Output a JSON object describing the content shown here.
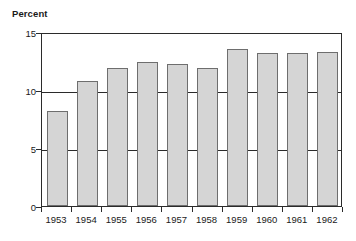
{
  "chart_data": {
    "type": "bar",
    "title": "",
    "subtitle": "",
    "xlabel": "",
    "ylabel": "Percent",
    "categories": [
      "1953",
      "1954",
      "1955",
      "1956",
      "1957",
      "1958",
      "1959",
      "1960",
      "1961",
      "1962"
    ],
    "values": [
      8.2,
      10.8,
      11.9,
      12.4,
      12.2,
      11.9,
      13.5,
      13.2,
      13.2,
      13.3
    ],
    "ylim": [
      0,
      15
    ],
    "yticks": [
      0,
      5,
      10,
      15
    ],
    "ytick_labels": [
      "0",
      "5",
      "10",
      "15"
    ],
    "xtick_labels": [
      "1953",
      "1954",
      "1955",
      "1956",
      "1957",
      "1958",
      "1959",
      "1960",
      "1961",
      "1962"
    ],
    "grid": true,
    "gridlines_at": [
      5,
      10,
      15
    ],
    "legend": null,
    "legend_position": "none",
    "annotations": [],
    "series": [
      {
        "name": "Percent",
        "values": [
          8.2,
          10.8,
          11.9,
          12.4,
          12.2,
          11.9,
          13.5,
          13.2,
          13.2,
          13.3
        ]
      }
    ]
  },
  "axis": {
    "y_title": "Percent"
  },
  "style": {
    "bar_fill": "#d5d5d5",
    "bar_border": "#6e6e6e",
    "axis_color": "#2b2b2b",
    "background": "#ffffff",
    "text_color": "#1a1a1a"
  }
}
